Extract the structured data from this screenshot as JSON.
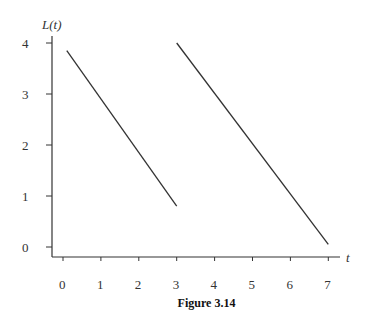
{
  "chart_data": {
    "type": "line",
    "title": "",
    "xlabel": "t",
    "ylabel": "L(t)",
    "xlim": [
      0,
      7
    ],
    "ylim": [
      0,
      4
    ],
    "x_ticks": [
      "0",
      "1",
      "2",
      "3",
      "4",
      "5",
      "6",
      "7"
    ],
    "y_ticks": [
      "0",
      "1",
      "2",
      "3",
      "4"
    ],
    "grid": false,
    "series": [
      {
        "name": "segment-1",
        "x": [
          0.1,
          3.0
        ],
        "y": [
          3.85,
          0.8
        ]
      },
      {
        "name": "segment-2",
        "x": [
          3.0,
          7.0
        ],
        "y": [
          4.0,
          0.05
        ]
      }
    ]
  },
  "caption": "Figure 3.14",
  "axes": {
    "x_label": "t",
    "y_label": "L(t)"
  }
}
